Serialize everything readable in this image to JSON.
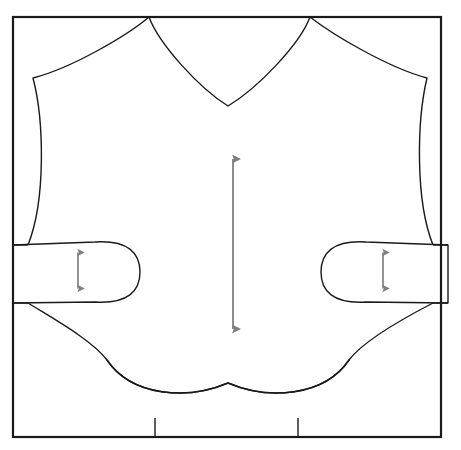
{
  "canvas": {
    "width": 461,
    "height": 450,
    "background": "#ffffff"
  },
  "figure": {
    "type": "technical-line-drawing",
    "line_color": "#1a1a1a",
    "fill_color": "#ffffff",
    "arrow_color": "#808080"
  },
  "frame": {
    "name": "fabric-boundary-rectangle",
    "x": 13,
    "y": 17,
    "width": 428,
    "height": 420,
    "stroke": "#1a1a1a",
    "stroke_width": 2.2
  },
  "garment": {
    "name": "garment-body-outline",
    "stroke": "#1a1a1a",
    "stroke_width": 1.4,
    "shoulder_left_x": 149,
    "shoulder_right_x": 310,
    "shoulder_top_y": 17,
    "neckline_bottom_x": 228,
    "neckline_bottom_y": 106,
    "shoulder_tip_left": [
      33,
      78
    ],
    "shoulder_tip_right": [
      427,
      78
    ],
    "side_seam_left_bottom_y": 245,
    "side_seam_right_bottom_y": 245,
    "crotch_peak_x": 228,
    "crotch_peak_y": 383,
    "hem_left_x": 155,
    "hem_right_x": 298,
    "hem_y": 418
  },
  "sleeves": {
    "left": {
      "name": "left-sleeve-lobe",
      "border_top_y": 245,
      "border_bottom_y": 303,
      "tip_x": 137,
      "center_y": 272
    },
    "right": {
      "name": "right-sleeve-lobe",
      "border_top_y": 245,
      "border_bottom_y": 303,
      "tip_x": 323,
      "center_y": 272
    }
  },
  "hem_dividers": {
    "name": "hem-divider-lines",
    "left_x": 155,
    "right_x": 298,
    "top_y": 418,
    "bottom_y": 437
  },
  "arrows": [
    {
      "id": "center-grain-arrow",
      "name": "center-length-measure-arrow",
      "orientation": "vertical",
      "double_headed": true,
      "x": 233,
      "y_top": 150,
      "y_bottom": 338,
      "length_px": 188,
      "color": "#808080"
    },
    {
      "id": "left-sleeve-arrow",
      "name": "left-sleeve-width-measure-arrow",
      "orientation": "vertical",
      "double_headed": true,
      "x": 78,
      "y_top": 245,
      "y_bottom": 296,
      "length_px": 51,
      "color": "#808080"
    },
    {
      "id": "right-sleeve-arrow",
      "name": "right-sleeve-width-measure-arrow",
      "orientation": "vertical",
      "double_headed": true,
      "x": 383,
      "y_top": 245,
      "y_bottom": 296,
      "length_px": 51,
      "color": "#808080"
    }
  ],
  "labels": {
    "title": "",
    "annotations": []
  }
}
